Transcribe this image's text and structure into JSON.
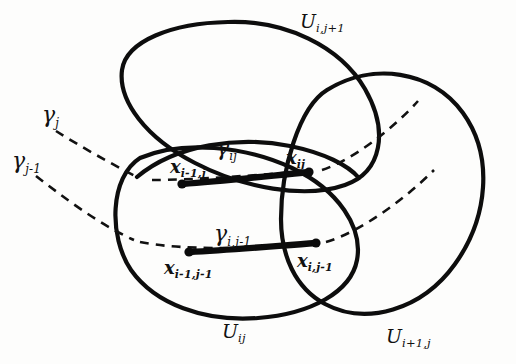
{
  "figure": {
    "kind": "topology-cover-diagram",
    "background_color": "#fdfdfc",
    "ink_color": "#0d0d0d",
    "labels": {
      "u_i_jplus1": {
        "base": "U",
        "sub": "i,j+1"
      },
      "u_ij": {
        "base": "U",
        "sub": "ij"
      },
      "u_iplus1_j": {
        "base": "U",
        "sub": "i+1,j"
      },
      "gamma_j": {
        "base": "γ",
        "sub": "j"
      },
      "gamma_jminus1": {
        "base": "γ",
        "sub": "j-1"
      },
      "gamma_ij": {
        "base": "γ",
        "sub": "ij"
      },
      "gamma_i_jminus1": {
        "base": "γ",
        "sub": "i,j-1"
      },
      "x_iminus1_j": {
        "base": "x",
        "sub": "i-1,j"
      },
      "x_ij": {
        "base": "x",
        "sub": "ij"
      },
      "x_iminus1_jminus1": {
        "base": "x",
        "sub": "i-1,j-1"
      },
      "x_i_jminus1": {
        "base": "x",
        "sub": "i,j-1"
      }
    },
    "regions": [
      {
        "name": "U_{i,j+1}",
        "shape": "tilted-ellipse",
        "label_key": "u_i_jplus1"
      },
      {
        "name": "U_{ij}",
        "shape": "tilted-ellipse",
        "label_key": "u_ij"
      },
      {
        "name": "U_{i+1,j}",
        "shape": "circle",
        "label_key": "u_iplus1_j"
      }
    ],
    "paths": [
      {
        "name": "gamma_j",
        "style": "dashed",
        "label_key": "gamma_j"
      },
      {
        "name": "gamma_j-1",
        "style": "dashed",
        "label_key": "gamma_jminus1"
      },
      {
        "name": "gamma_ij",
        "style": "solid-thick",
        "label_key": "gamma_ij",
        "endpoints": [
          "x_iminus1_j",
          "x_ij"
        ]
      },
      {
        "name": "gamma_i,j-1",
        "style": "solid-thick",
        "label_key": "gamma_i_jminus1",
        "endpoints": [
          "x_iminus1_jminus1",
          "x_i_jminus1"
        ]
      }
    ],
    "points": [
      {
        "key": "x_iminus1_j",
        "x": 182,
        "y": 184
      },
      {
        "key": "x_ij",
        "x": 309,
        "y": 172
      },
      {
        "key": "x_iminus1_jminus1",
        "x": 189,
        "y": 252
      },
      {
        "key": "x_i_jminus1",
        "x": 316,
        "y": 243
      }
    ]
  }
}
